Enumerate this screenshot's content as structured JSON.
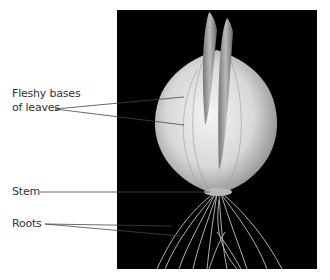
{
  "figure": {
    "labels": [
      {
        "id": "fleshy-bases",
        "line1": "Fleshy bases",
        "line2": "of leaves"
      },
      {
        "id": "stem",
        "text": "Stem"
      },
      {
        "id": "roots",
        "text": "Roots"
      }
    ]
  },
  "colors": {
    "background": "#ffffff",
    "photo_background": "#000000",
    "label_text": "#333333",
    "leader_line": "#444444"
  }
}
